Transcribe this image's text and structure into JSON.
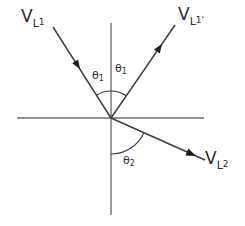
{
  "diagram": {
    "type": "vector reflection/refraction angle diagram",
    "origin": {
      "x": 111,
      "y": 118
    },
    "axes": {
      "horizontal": {
        "x1": 17,
        "x2": 204,
        "y": 118
      },
      "vertical": {
        "x": 111,
        "y1": 23,
        "y2": 215
      }
    },
    "vectors": [
      {
        "id": "incident",
        "label_main": "V",
        "label_sub": "L",
        "label_subsub": "1",
        "direction": "toward origin"
      },
      {
        "id": "reflected",
        "label_main": "V",
        "label_sub": "L",
        "label_subsub": "1'",
        "direction": "away from origin"
      },
      {
        "id": "transmitted",
        "label_main": "V",
        "label_sub": "L",
        "label_subsub": "2",
        "direction": "away from origin"
      }
    ],
    "angles": [
      {
        "id": "theta1-incident",
        "symbol": "θ",
        "sub": "1"
      },
      {
        "id": "theta1-reflected",
        "symbol": "θ",
        "sub": "1"
      },
      {
        "id": "theta2-transmitted",
        "symbol": "θ",
        "sub": "2"
      }
    ],
    "colors": {
      "axis": "#6e6e6e",
      "ray": "#3a3a3a",
      "arrowhead": "#1a1a1a",
      "text": "#2a2a2a",
      "background": "#ffffff"
    }
  }
}
